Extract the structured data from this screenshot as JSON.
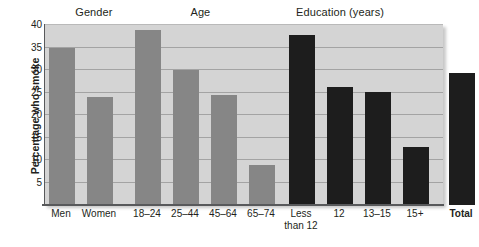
{
  "chart_data": {
    "type": "bar",
    "title": "",
    "subtitle": "",
    "xlabel": "",
    "ylabel": "Percentage who smoke",
    "ylim": [
      0,
      40
    ],
    "ytick_values": [
      40,
      35,
      30,
      25,
      20,
      15,
      10,
      5
    ],
    "ytick_labels": [
      "40",
      "35",
      "30",
      "25",
      "20",
      "15",
      "10",
      "5"
    ],
    "grid": true,
    "legend": "none",
    "group_headers": [
      {
        "label": "Gender",
        "center_pct": 0.125
      },
      {
        "label": "Age",
        "center_pct": 0.392
      },
      {
        "label": "Education (years)",
        "center_pct": 0.742
      }
    ],
    "categories": [
      "Men",
      "Women",
      "18–24",
      "25–44",
      "45–64",
      "65–74",
      "Less\nthan 12",
      "12",
      "13–15",
      "15+",
      "Total"
    ],
    "values": [
      35.0,
      24.0,
      39.0,
      30.0,
      24.4,
      9.0,
      37.7,
      26.3,
      25.2,
      13.0,
      29.3
    ],
    "bars": [
      {
        "label": "Men",
        "value": 35.0,
        "group": "Gender",
        "color": "#868686",
        "x": 48,
        "width": 26
      },
      {
        "label": "Women",
        "value": 24.0,
        "group": "Gender",
        "color": "#868686",
        "x": 86,
        "width": 26
      },
      {
        "label": "18–24",
        "value": 39.0,
        "group": "Age",
        "color": "#868686",
        "x": 134,
        "width": 26
      },
      {
        "label": "25–44",
        "value": 30.0,
        "group": "Age",
        "color": "#868686",
        "x": 172,
        "width": 26
      },
      {
        "label": "45–64",
        "value": 24.4,
        "group": "Age",
        "color": "#868686",
        "x": 210,
        "width": 26
      },
      {
        "label": "65–74",
        "value": 9.0,
        "group": "Age",
        "color": "#868686",
        "x": 248,
        "width": 26
      },
      {
        "label": "Less\nthan 12",
        "value": 37.7,
        "group": "Education (years)",
        "color": "#1d1d1d",
        "x": 288,
        "width": 26
      },
      {
        "label": "12",
        "value": 26.3,
        "group": "Education (years)",
        "color": "#1d1d1d",
        "x": 326,
        "width": 26
      },
      {
        "label": "13–15",
        "value": 25.2,
        "group": "Education (years)",
        "color": "#1d1d1d",
        "x": 364,
        "width": 26
      },
      {
        "label": "15+",
        "value": 13.0,
        "group": "Education (years)",
        "color": "#1d1d1d",
        "x": 402,
        "width": 26
      },
      {
        "label": "Total",
        "value": 29.3,
        "group": "Total",
        "color": "#1d1d1d",
        "x": 448,
        "width": 26
      }
    ],
    "colors": {
      "light_bar": "#868686",
      "dark_bar": "#1d1d1d",
      "plot_background": "#d4d4d4",
      "gridline": "#a3a3a3",
      "axis": "#58595b",
      "text": "#231f20",
      "page_background": "#ffffff"
    }
  }
}
